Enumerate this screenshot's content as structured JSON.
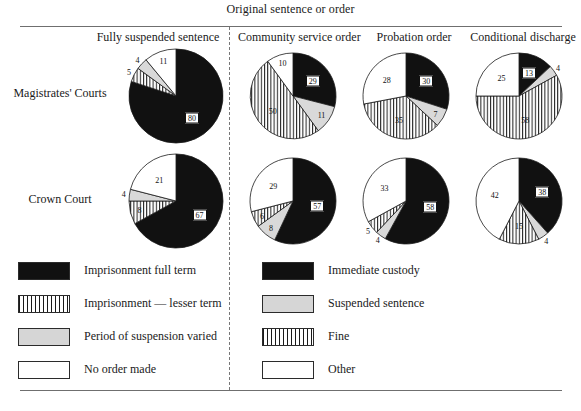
{
  "figure": {
    "supertitle": "Original sentence or order",
    "column_headers": [
      "Fully suspended sentence",
      "Community service order",
      "Probation order",
      "Conditional discharge"
    ],
    "row_labels": [
      "Magistrates' Courts",
      "Crown Court"
    ]
  },
  "legend_left": {
    "items": [
      {
        "label": "Imprisonment full term",
        "swatch": "black",
        "color": "#111111"
      },
      {
        "label": "Imprisonment — lesser term",
        "swatch": "stripe",
        "color": "#1a1a1a"
      },
      {
        "label": "Period of suspension varied",
        "swatch": "grey",
        "color": "#d6d6d6"
      },
      {
        "label": "No order made",
        "swatch": "white",
        "color": "#ffffff"
      }
    ]
  },
  "legend_right": {
    "items": [
      {
        "label": "Immediate custody",
        "swatch": "black",
        "color": "#111111"
      },
      {
        "label": "Suspended sentence",
        "swatch": "grey",
        "color": "#d6d6d6"
      },
      {
        "label": "Fine",
        "swatch": "stripe",
        "color": "#1a1a1a"
      },
      {
        "label": "Other",
        "swatch": "white",
        "color": "#ffffff"
      }
    ]
  },
  "chart_data": {
    "type": "pie",
    "title": "Original sentence or order",
    "grid": false,
    "legend_position": "bottom",
    "note": "Grid of 8 pie charts: 2 rows (court type) x 4 columns (original sentence or order). Values are percentages. Left two columns use the left legend (suspended-sentence breach outcomes); right columns use the right legend.",
    "rows": [
      "Magistrates' Courts",
      "Crown Court"
    ],
    "columns": [
      "Fully suspended sentence",
      "Community service order",
      "Probation order",
      "Conditional discharge"
    ],
    "charts": [
      {
        "row": "Magistrates' Courts",
        "column": "Fully suspended sentence",
        "legend": "left",
        "slices": [
          {
            "label": "Imprisonment full term",
            "value": 80,
            "fill": "black",
            "boxed": true
          },
          {
            "label": "Imprisonment — lesser term",
            "value": 5,
            "fill": "stripe",
            "boxed": false
          },
          {
            "label": "Period of suspension varied",
            "value": 4,
            "fill": "grey",
            "boxed": false
          },
          {
            "label": "No order made",
            "value": 11,
            "fill": "white",
            "boxed": false
          }
        ]
      },
      {
        "row": "Magistrates' Courts",
        "column": "Community service order",
        "legend": "right",
        "slices": [
          {
            "label": "Immediate custody",
            "value": 29,
            "fill": "black",
            "boxed": true
          },
          {
            "label": "Suspended sentence",
            "value": 11,
            "fill": "grey",
            "boxed": false
          },
          {
            "label": "Fine",
            "value": 50,
            "fill": "stripe",
            "boxed": false
          },
          {
            "label": "Other",
            "value": 10,
            "fill": "white",
            "boxed": false
          }
        ]
      },
      {
        "row": "Magistrates' Courts",
        "column": "Probation order",
        "legend": "right",
        "slices": [
          {
            "label": "Immediate custody",
            "value": 30,
            "fill": "black",
            "boxed": true
          },
          {
            "label": "Suspended sentence",
            "value": 7,
            "fill": "grey",
            "boxed": false
          },
          {
            "label": "Fine",
            "value": 35,
            "fill": "stripe",
            "boxed": false
          },
          {
            "label": "Other",
            "value": 28,
            "fill": "white",
            "boxed": false
          }
        ]
      },
      {
        "row": "Magistrates' Courts",
        "column": "Conditional discharge",
        "legend": "right",
        "slices": [
          {
            "label": "Immediate custody",
            "value": 13,
            "fill": "black",
            "boxed": true
          },
          {
            "label": "Suspended sentence",
            "value": 4,
            "fill": "grey",
            "boxed": false
          },
          {
            "label": "Fine",
            "value": 58,
            "fill": "stripe",
            "boxed": false
          },
          {
            "label": "Other",
            "value": 25,
            "fill": "white",
            "boxed": false
          }
        ]
      },
      {
        "row": "Crown Court",
        "column": "Fully suspended sentence",
        "legend": "left",
        "slices": [
          {
            "label": "Imprisonment full term",
            "value": 67,
            "fill": "black",
            "boxed": true
          },
          {
            "label": "Imprisonment — lesser term",
            "value": 8,
            "fill": "stripe",
            "boxed": false
          },
          {
            "label": "Period of suspension varied",
            "value": 4,
            "fill": "grey",
            "boxed": false
          },
          {
            "label": "No order made",
            "value": 21,
            "fill": "white",
            "boxed": false
          }
        ]
      },
      {
        "row": "Crown Court",
        "column": "Community service order",
        "legend": "right",
        "slices": [
          {
            "label": "Immediate custody",
            "value": 57,
            "fill": "black",
            "boxed": true
          },
          {
            "label": "Suspended sentence",
            "value": 8,
            "fill": "grey",
            "boxed": false
          },
          {
            "label": "Fine",
            "value": 6,
            "fill": "stripe",
            "boxed": false
          },
          {
            "label": "Other",
            "value": 29,
            "fill": "white",
            "boxed": false
          }
        ]
      },
      {
        "row": "Crown Court",
        "column": "Probation order",
        "legend": "right",
        "slices": [
          {
            "label": "Immediate custody",
            "value": 58,
            "fill": "black",
            "boxed": true
          },
          {
            "label": "Suspended sentence",
            "value": 4,
            "fill": "grey",
            "boxed": false
          },
          {
            "label": "Fine",
            "value": 5,
            "fill": "stripe",
            "boxed": false
          },
          {
            "label": "Other",
            "value": 33,
            "fill": "white",
            "boxed": false
          }
        ]
      },
      {
        "row": "Crown Court",
        "column": "Conditional discharge",
        "legend": "right",
        "slices": [
          {
            "label": "Immediate custody",
            "value": 38,
            "fill": "black",
            "boxed": true
          },
          {
            "label": "Suspended sentence",
            "value": 4,
            "fill": "grey",
            "boxed": false
          },
          {
            "label": "Fine",
            "value": 15,
            "fill": "stripe",
            "boxed": false
          },
          {
            "label": "Other",
            "value": 42,
            "fill": "white",
            "boxed": false
          }
        ]
      }
    ]
  },
  "layout": {
    "pie_centers": [
      {
        "cx": 176,
        "cy": 96,
        "r": 47
      },
      {
        "cx": 293,
        "cy": 96,
        "r": 43
      },
      {
        "cx": 406,
        "cy": 96,
        "r": 43
      },
      {
        "cx": 519,
        "cy": 96,
        "r": 43
      },
      {
        "cx": 176,
        "cy": 201,
        "r": 47
      },
      {
        "cx": 293,
        "cy": 201,
        "r": 43
      },
      {
        "cx": 406,
        "cy": 201,
        "r": 43
      },
      {
        "cx": 519,
        "cy": 201,
        "r": 43
      }
    ],
    "legend_left_x": 18,
    "legend_right_x": 262,
    "legend_y_start": 262,
    "legend_row_step": 33
  }
}
